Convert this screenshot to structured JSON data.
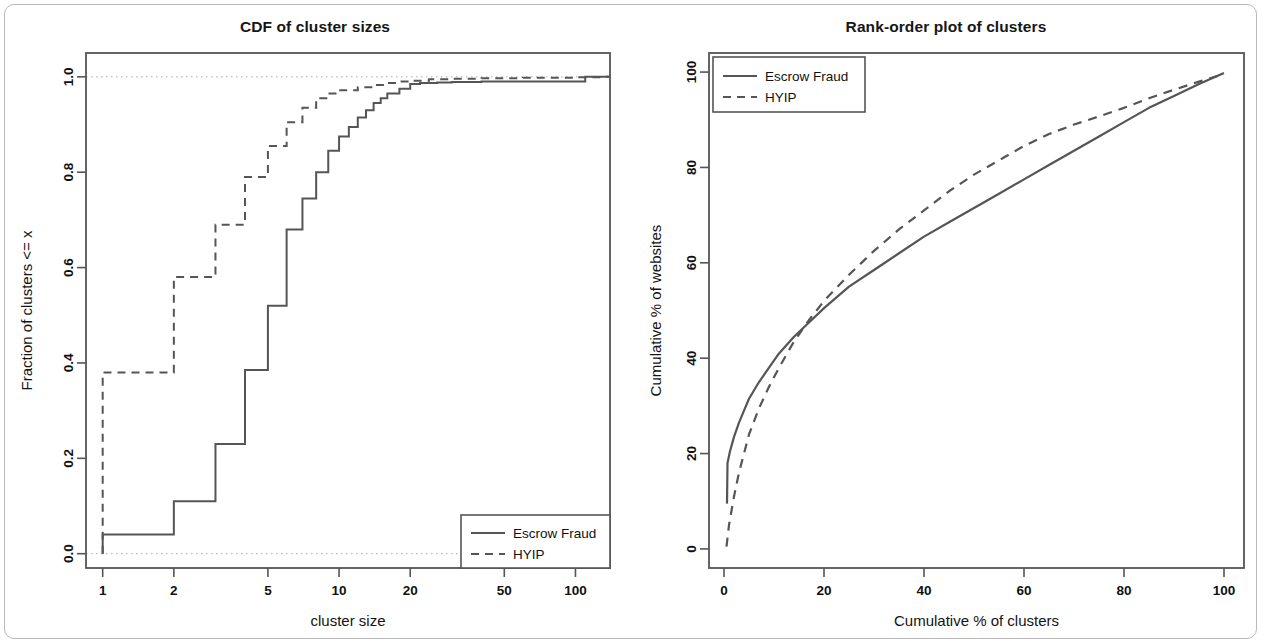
{
  "figure": {
    "background": "#ffffff",
    "frame_color": "#b9b9b9",
    "line_color": "#555555",
    "text_color": "#111111"
  },
  "panels": [
    {
      "id": "cdf-panel",
      "title": "CDF of cluster sizes",
      "xlabel": "cluster size",
      "ylabel": "Fraction of clusters <= x",
      "legend": {
        "position": "bottom-right",
        "items": [
          {
            "label": "Escrow Fraud",
            "style": "solid"
          },
          {
            "label": "HYIP",
            "style": "dashed"
          }
        ]
      }
    },
    {
      "id": "rank-order-panel",
      "title": "Rank-order plot of clusters",
      "xlabel": "Cumulative % of clusters",
      "ylabel": "Cumulative % of websites",
      "legend": {
        "position": "top-left",
        "items": [
          {
            "label": "Escrow Fraud",
            "style": "solid"
          },
          {
            "label": "HYIP",
            "style": "dashed"
          }
        ]
      }
    }
  ],
  "chart_data": [
    {
      "type": "line",
      "id": "cdf-of-cluster-sizes",
      "title": "CDF of cluster sizes",
      "xlabel": "cluster size",
      "ylabel": "Fraction of clusters <= x",
      "xscale": "log",
      "yscale": "linear",
      "xlim": [
        0.85,
        140
      ],
      "ylim": [
        -0.03,
        1.05
      ],
      "xticks": [
        1,
        2,
        5,
        10,
        20,
        50,
        100
      ],
      "xtick_labels": [
        "1",
        "2",
        "5",
        "10",
        "20",
        "50",
        "100"
      ],
      "yticks": [
        0.0,
        0.2,
        0.4,
        0.6,
        0.8,
        1.0
      ],
      "ytick_labels": [
        "0.0",
        "0.2",
        "0.4",
        "0.6",
        "0.8",
        "1.0"
      ],
      "grid": "dotted reference lines at y=0.0 and y=1.0",
      "legend_position": "bottom-right",
      "series": [
        {
          "name": "Escrow Fraud",
          "style": "solid",
          "step": "hv",
          "x": [
            1,
            1,
            2,
            3,
            4,
            5,
            6,
            7,
            8,
            9,
            10,
            11,
            12,
            13,
            14,
            15,
            16,
            18,
            20,
            22,
            26,
            30,
            40,
            60,
            90,
            110,
            130
          ],
          "y": [
            0.0,
            0.04,
            0.11,
            0.23,
            0.385,
            0.52,
            0.68,
            0.745,
            0.8,
            0.845,
            0.875,
            0.895,
            0.915,
            0.93,
            0.945,
            0.955,
            0.965,
            0.975,
            0.985,
            0.987,
            0.988,
            0.989,
            0.99,
            0.99,
            0.99,
            1.0,
            1.0
          ]
        },
        {
          "name": "HYIP",
          "style": "dashed",
          "step": "hv",
          "x": [
            1,
            1,
            2,
            3,
            4,
            5,
            6,
            7,
            8,
            9,
            10,
            12,
            14,
            16,
            18,
            20,
            24,
            30,
            40,
            60,
            100,
            130
          ],
          "y": [
            0.0,
            0.38,
            0.58,
            0.69,
            0.79,
            0.855,
            0.905,
            0.935,
            0.955,
            0.965,
            0.972,
            0.978,
            0.983,
            0.987,
            0.99,
            0.992,
            0.995,
            0.996,
            0.997,
            0.998,
            0.999,
            1.0
          ]
        }
      ]
    },
    {
      "type": "line",
      "id": "rank-order-plot-of-clusters",
      "title": "Rank-order plot of clusters",
      "xlabel": "Cumulative % of clusters",
      "ylabel": "Cumulative % of websites",
      "xscale": "linear",
      "yscale": "linear",
      "xlim": [
        -3,
        104
      ],
      "ylim": [
        -4,
        104
      ],
      "xticks": [
        0,
        20,
        40,
        60,
        80,
        100
      ],
      "xtick_labels": [
        "0",
        "20",
        "40",
        "60",
        "80",
        "100"
      ],
      "yticks": [
        0,
        20,
        40,
        60,
        80,
        100
      ],
      "ytick_labels": [
        "0",
        "20",
        "40",
        "60",
        "80",
        "100"
      ],
      "grid": "none",
      "legend_position": "top-left",
      "series": [
        {
          "name": "Escrow Fraud",
          "style": "solid",
          "x": [
            0.6,
            0.7,
            1.2,
            2,
            3,
            4,
            5,
            7,
            9,
            11,
            14,
            17,
            20,
            25,
            30,
            35,
            40,
            45,
            50,
            55,
            60,
            65,
            70,
            75,
            80,
            85,
            90,
            95,
            100
          ],
          "y": [
            9.5,
            18,
            20.5,
            23.5,
            26.5,
            29,
            31.5,
            35,
            38,
            41,
            44.5,
            47.5,
            50.5,
            55,
            58.5,
            62,
            65.5,
            68.5,
            71.5,
            74.5,
            77.5,
            80.5,
            83.5,
            86.5,
            89.5,
            92.5,
            95,
            97.5,
            99.8
          ]
        },
        {
          "name": "HYIP",
          "style": "dashed",
          "x": [
            0.5,
            1,
            2,
            3,
            4,
            5,
            7,
            9,
            11,
            14,
            17,
            20,
            25,
            30,
            35,
            40,
            45,
            50,
            55,
            60,
            65,
            70,
            75,
            80,
            85,
            90,
            95,
            100
          ],
          "y": [
            0.5,
            5,
            11,
            16,
            20,
            24,
            29.5,
            34,
            38,
            43.5,
            48,
            52,
            57.5,
            62.5,
            67,
            71,
            75,
            78.5,
            81.5,
            84.5,
            87,
            89,
            90.7,
            92.5,
            94.5,
            96.3,
            98,
            99.6
          ]
        }
      ]
    }
  ]
}
